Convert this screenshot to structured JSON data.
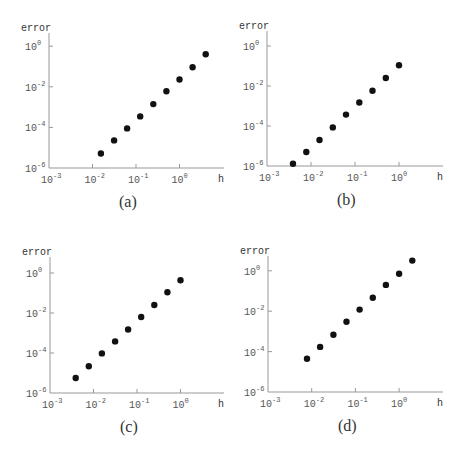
{
  "figure": {
    "axis_labels": {
      "x": "h",
      "y": "error"
    },
    "x_ticks": [
      {
        "exp": -3,
        "label": "10",
        "sup": "-3"
      },
      {
        "exp": -2,
        "label": "10",
        "sup": "-2"
      },
      {
        "exp": -1,
        "label": "10",
        "sup": "-1"
      },
      {
        "exp": 0,
        "label": "10",
        "sup": "0"
      }
    ],
    "y_ticks": [
      {
        "exp": 0,
        "label": "10",
        "sup": "0"
      },
      {
        "exp": -2,
        "label": "10",
        "sup": "-2"
      },
      {
        "exp": -4,
        "label": "10",
        "sup": "-4"
      },
      {
        "exp": -6,
        "label": "10",
        "sup": "-6"
      }
    ],
    "marker_color": "#111111",
    "axis_color": "#999999"
  },
  "chart_data": [
    {
      "type": "scatter",
      "title": "(a)",
      "xlabel": "h",
      "ylabel": "error",
      "xscale": "log",
      "yscale": "log",
      "xlim": [
        0.001,
        10
      ],
      "ylim": [
        1e-06,
        5
      ],
      "grid": false,
      "x": [
        0.0156,
        0.0313,
        0.0625,
        0.125,
        0.25,
        0.5,
        1,
        2,
        4
      ],
      "y": [
        5.2e-06,
        2.3e-05,
        8.9e-05,
        0.00035,
        0.0014,
        0.006,
        0.023,
        0.091,
        0.4
      ]
    },
    {
      "type": "scatter",
      "title": "(b)",
      "xlabel": "h",
      "ylabel": "error",
      "xscale": "log",
      "yscale": "log",
      "xlim": [
        0.001,
        10
      ],
      "ylim": [
        1e-06,
        5
      ],
      "grid": false,
      "x": [
        0.0039,
        0.0078,
        0.0156,
        0.0313,
        0.0625,
        0.125,
        0.25,
        0.5,
        1
      ],
      "y": [
        1.3e-06,
        5e-06,
        2e-05,
        8.5e-05,
        0.00037,
        0.0015,
        0.0058,
        0.025,
        0.11
      ]
    },
    {
      "type": "scatter",
      "title": "(c)",
      "xlabel": "h",
      "ylabel": "error",
      "xscale": "log",
      "yscale": "log",
      "xlim": [
        0.001,
        10
      ],
      "ylim": [
        1e-06,
        5
      ],
      "grid": false,
      "x": [
        0.0039,
        0.0078,
        0.0156,
        0.0313,
        0.0625,
        0.125,
        0.25,
        0.5,
        1
      ],
      "y": [
        5.6e-06,
        2.2e-05,
        9.5e-05,
        0.00038,
        0.0015,
        0.0063,
        0.025,
        0.11,
        0.43
      ]
    },
    {
      "type": "scatter",
      "title": "(d)",
      "xlabel": "h",
      "ylabel": "error",
      "xscale": "log",
      "yscale": "log",
      "xlim": [
        0.001,
        10
      ],
      "ylim": [
        1e-06,
        5
      ],
      "grid": false,
      "x": [
        0.0078,
        0.0156,
        0.0313,
        0.0625,
        0.125,
        0.25,
        0.5,
        1,
        2
      ],
      "y": [
        4.4e-05,
        0.00017,
        0.00068,
        0.003,
        0.012,
        0.046,
        0.2,
        0.71,
        3.2
      ]
    }
  ],
  "panels": [
    {
      "caption": "(a)",
      "left": 0,
      "top": 0,
      "axis_x": 49,
      "axis_y": 168,
      "decade_x": 43.5,
      "decade_y": 20.3,
      "x_axis_end": 224,
      "y_axis_top": 33
    },
    {
      "caption": "(b)",
      "left": 0,
      "top": 0,
      "axis_x": 267,
      "axis_y": 166,
      "decade_x": 44,
      "decade_y": 20.0,
      "x_axis_end": 443,
      "y_axis_top": 31
    },
    {
      "caption": "(c)",
      "left": 0,
      "top": 0,
      "axis_x": 50,
      "axis_y": 393,
      "decade_x": 43.5,
      "decade_y": 20.0,
      "x_axis_end": 224,
      "y_axis_top": 257
    },
    {
      "caption": "(d)",
      "left": 0,
      "top": 0,
      "axis_x": 268,
      "axis_y": 392,
      "decade_x": 43.7,
      "decade_y": 20.2,
      "x_axis_end": 443,
      "y_axis_top": 256
    }
  ]
}
